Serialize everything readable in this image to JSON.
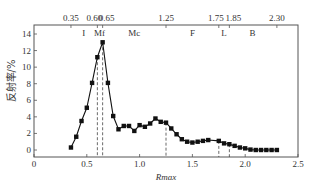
{
  "chart_data": {
    "type": "line",
    "title": "",
    "xlabel": "Rmax",
    "ylabel": "反射率/%",
    "xlim": [
      0,
      2.5
    ],
    "ylim": [
      0,
      14
    ],
    "grid": false,
    "legend": null,
    "x_ticks": [
      "0",
      "0.5",
      "1.0",
      "1.5",
      "2.0",
      "2.5"
    ],
    "y_ticks": [
      "0",
      "2",
      "4",
      "6",
      "8",
      "10",
      "12",
      "14"
    ],
    "top_axis_ticks": [
      "0.35",
      "0.60",
      "0.65",
      "1.25",
      "1.75",
      "1.85",
      "2.30"
    ],
    "region_labels": [
      {
        "label": "I",
        "x": 0.47
      },
      {
        "label": "Mf",
        "x": 0.62
      },
      {
        "label": "Mc",
        "x": 0.95
      },
      {
        "label": "F",
        "x": 1.5
      },
      {
        "label": "L",
        "x": 1.8
      },
      {
        "label": "B",
        "x": 2.07
      }
    ],
    "dashed_lines_x": [
      0.6,
      0.65,
      1.25,
      1.75,
      1.85
    ],
    "series": [
      {
        "name": "反射率",
        "marker": "square",
        "x": [
          0.35,
          0.4,
          0.45,
          0.5,
          0.55,
          0.6,
          0.65,
          0.7,
          0.75,
          0.8,
          0.85,
          0.9,
          0.95,
          1.0,
          1.05,
          1.1,
          1.15,
          1.2,
          1.25,
          1.3,
          1.35,
          1.4,
          1.45,
          1.5,
          1.55,
          1.6,
          1.65,
          1.75,
          1.8,
          1.85,
          1.9,
          1.95,
          2.0,
          2.05,
          2.1,
          2.15,
          2.2,
          2.25,
          2.3
        ],
        "values": [
          0.3,
          1.6,
          3.5,
          5.1,
          8.1,
          11.2,
          13.0,
          8.1,
          4.1,
          2.5,
          2.9,
          2.9,
          2.3,
          3.0,
          2.8,
          3.2,
          3.8,
          3.4,
          3.3,
          2.6,
          1.9,
          1.3,
          1.0,
          0.9,
          1.0,
          1.1,
          1.2,
          1.1,
          0.8,
          0.7,
          0.5,
          0.3,
          0.2,
          0.05,
          0.0,
          0.0,
          0.0,
          0.0,
          0.0
        ]
      }
    ]
  }
}
